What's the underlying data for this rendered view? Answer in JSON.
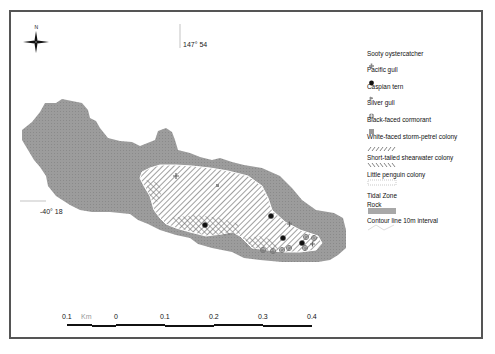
{
  "map": {
    "compass": {
      "north_label": "N",
      "icon": "compass-rose-icon"
    },
    "grid_labels": {
      "longitude": "147° 54",
      "latitude": "-40° 18"
    },
    "colors": {
      "rock": "#9a9a9a",
      "frame": "#555555",
      "pacific_gull": "#111111",
      "marker": "#777777"
    },
    "legend": {
      "items": [
        {
          "label": "Sooty oystercatcher",
          "symbol": "plus-icon"
        },
        {
          "label": "Pacific gull",
          "symbol": "dot-icon"
        },
        {
          "label": "Caspian tern",
          "symbol": "flag-icon"
        },
        {
          "label": "Silver gull",
          "symbol": "crossed-circle-icon"
        },
        {
          "label": "Black-faced cormorant",
          "symbol": "square-icon"
        },
        {
          "label": "White-faced storm-petrel colony",
          "symbol": "forward-hatch-icon"
        },
        {
          "label": "Short-tailed shearwater colony",
          "symbol": "back-hatch-icon"
        },
        {
          "label": "Little penguin colony",
          "symbol": "dotted-fill-icon"
        },
        {
          "label": "Tidal Zone",
          "symbol": ""
        },
        {
          "label": "Rock",
          "symbol": "gray-fill-icon"
        },
        {
          "label": "Contour line 10m interval",
          "symbol": "contour-line-icon"
        }
      ]
    },
    "scale_bar": {
      "unit": "Km",
      "labels": [
        "0.1",
        "0",
        "0.1",
        "0.2",
        "0.3",
        "0.4"
      ]
    }
  }
}
